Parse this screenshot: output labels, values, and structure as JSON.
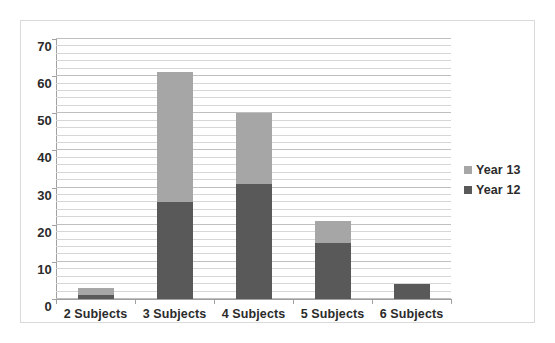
{
  "chart_data": {
    "type": "bar",
    "subtype": "stacked-bar",
    "title": "",
    "xlabel": "",
    "ylabel": "",
    "ylim": [
      0,
      70
    ],
    "y_major_step": 10,
    "y_minor_step": 2,
    "grid": true,
    "legend_position": "right",
    "categories": [
      "2 Subjects",
      "3 Subjects",
      "4 Subjects",
      "5 Subjects",
      "6 Subjects"
    ],
    "y_ticks": [
      0,
      10,
      20,
      30,
      40,
      50,
      60,
      70
    ],
    "series": [
      {
        "name": "Year 12",
        "color": "#595959",
        "values": [
          1,
          26,
          31,
          15,
          4
        ]
      },
      {
        "name": "Year 13",
        "color": "#a6a6a6",
        "values": [
          2,
          35,
          19,
          6,
          0
        ]
      }
    ],
    "totals": [
      3,
      61,
      50,
      21,
      4
    ],
    "legend": [
      {
        "label": "Year 13",
        "color": "#a6a6a6"
      },
      {
        "label": "Year 12",
        "color": "#595959"
      }
    ]
  },
  "colors": {
    "series_light": "#a6a6a6",
    "series_dark": "#595959",
    "frame_border": "#d9d9d9",
    "gridline": "#d6d6d6",
    "axis_line": "#a0a0a0",
    "text": "#2b2b2b",
    "background": "#ffffff"
  }
}
